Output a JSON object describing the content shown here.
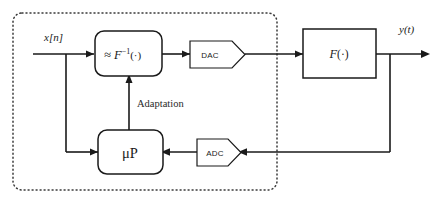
{
  "diagram": {
    "colors": {
      "line": "#1a1a1a",
      "dotted_region": "#3b3b3b",
      "background": "#ffffff",
      "text": "#1a1a1a"
    },
    "signals": {
      "input_label": "x[n]",
      "output_label": "y(t)"
    },
    "annotations": {
      "adaptation_label": "Adaptation"
    },
    "blocks": {
      "predistorter": {
        "label": "≈ F",
        "label_full": "≈ F⁻¹(·)",
        "exponent": "−1",
        "argument": "(·)",
        "shape": "rounded-rectangle"
      },
      "dac": {
        "label": "DAC",
        "shape": "pentagon-right"
      },
      "system": {
        "label": "F",
        "argument": "(·)",
        "label_full": "F(·)",
        "shape": "rectangle"
      },
      "adc": {
        "label": "ADC",
        "shape": "pentagon-right"
      },
      "microprocessor": {
        "label": "μP",
        "shape": "rounded-rectangle"
      }
    }
  }
}
